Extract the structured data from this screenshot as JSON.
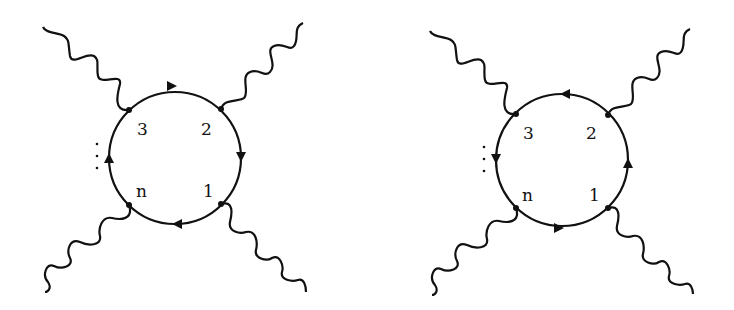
{
  "diagrams": [
    {
      "name": "loop-clockwise",
      "center": [
        175,
        158
      ],
      "radius": 66,
      "orientation": "clockwise",
      "labels": {
        "v3": "3",
        "v2": "2",
        "v1": "1",
        "vn": "n"
      },
      "ellipsis": "⋮"
    },
    {
      "name": "loop-counterclockwise",
      "center": [
        562,
        160
      ],
      "radius": 66,
      "orientation": "counterclockwise",
      "labels": {
        "v3": "3",
        "v2": "2",
        "v1": "1",
        "vn": "n"
      },
      "ellipsis": "⋮"
    }
  ],
  "colors": {
    "line": "#111111",
    "background": "#ffffff"
  }
}
